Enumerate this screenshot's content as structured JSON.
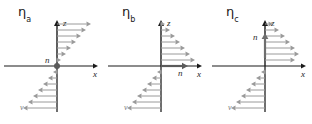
{
  "figure": {
    "background": "#ffffff",
    "panel_width": 104,
    "panel_height": 124,
    "axis_color": "#1a1a1a",
    "profile_arrow_color": "#9a9a9a",
    "normal_vector_color": "#6e6e6e",
    "label_color": "#1a1a1a"
  },
  "geometry": {
    "origin_x": 57,
    "origin_y": 66,
    "z_axis_top": 20,
    "x_axis_left": 4,
    "x_axis_right": 98,
    "profile_bottom": 112,
    "arrow_spacing": 6
  },
  "panels": [
    {
      "id": "panel-a",
      "offset_x": 0,
      "title": "η",
      "subscript": "a",
      "title_x": 18,
      "title_y": 4,
      "axes": {
        "z_label": "z",
        "x_label": "x"
      },
      "normal": {
        "type": "point",
        "label": "n",
        "label_x": 45,
        "label_y": 63,
        "marker_x": 57,
        "marker_y": 66,
        "marker_radius": 3
      },
      "upper_profile": {
        "direction": "right",
        "shape": "linear-increasing",
        "count": 7,
        "lengths": [
          4,
          9,
          14,
          19,
          24,
          29,
          34
        ]
      },
      "lower_profile": {
        "direction": "left",
        "shape": "linear-increasing",
        "count": 7,
        "lengths": [
          4,
          9,
          14,
          19,
          24,
          29,
          34
        ]
      },
      "velocity_label": {
        "text": "v",
        "x": 20,
        "y": 110
      }
    },
    {
      "id": "panel-b",
      "offset_x": 104,
      "title": "η",
      "subscript": "b",
      "title_x": 18,
      "title_y": 4,
      "axes": {
        "z_label": "z",
        "x_label": "x"
      },
      "normal": {
        "type": "arrow-right",
        "label": "n",
        "label_x": 74,
        "label_y": 76,
        "start_x": 57,
        "start_y": 66,
        "end_x": 84,
        "end_y": 66
      },
      "upper_profile": {
        "direction": "right",
        "shape": "linear-decreasing",
        "count": 7,
        "lengths": [
          34,
          29,
          24,
          19,
          14,
          9,
          4
        ]
      },
      "lower_profile": {
        "direction": "left",
        "shape": "linear-increasing",
        "count": 7,
        "lengths": [
          4,
          9,
          14,
          19,
          24,
          29,
          34
        ]
      },
      "velocity_label": {
        "text": "v",
        "x": 20,
        "y": 110
      }
    },
    {
      "id": "panel-c",
      "offset_x": 208,
      "title": "η",
      "subscript": "c",
      "title_x": 18,
      "title_y": 4,
      "axes": {
        "z_label": "z",
        "x_label": "x"
      },
      "normal": {
        "type": "arrow-up",
        "label": "n",
        "label_x": 45,
        "label_y": 40,
        "start_x": 57,
        "start_y": 58,
        "end_x": 57,
        "end_y": 33
      },
      "upper_profile": {
        "direction": "right",
        "shape": "peak-middle",
        "count": 7,
        "lengths": [
          30,
          34,
          30,
          25,
          20,
          14,
          8
        ]
      },
      "lower_profile": {
        "direction": "left",
        "shape": "linear-increasing",
        "count": 7,
        "lengths": [
          4,
          9,
          14,
          19,
          24,
          29,
          34
        ]
      },
      "velocity_label": {
        "text": "v",
        "x": 20,
        "y": 110
      }
    }
  ]
}
